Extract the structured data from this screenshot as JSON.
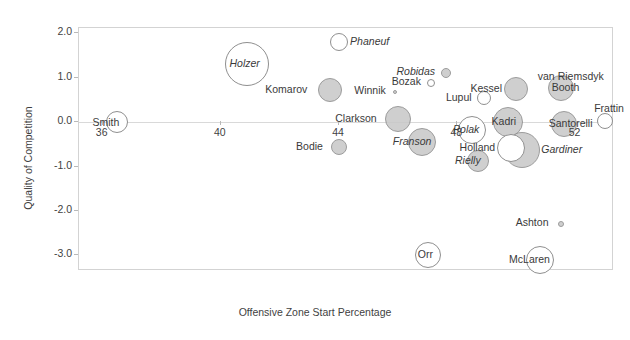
{
  "chart_data": {
    "type": "scatter",
    "title": "",
    "xlabel": "Offensive Zone Start Percentage",
    "ylabel": "Quality of Competition",
    "xlim": [
      35.2,
      53.3
    ],
    "ylim": [
      -3.35,
      2.12
    ],
    "xticks": [
      36,
      40,
      44,
      48,
      52
    ],
    "yticks": [
      2.0,
      1.0,
      0.0,
      -1.0,
      -2.0,
      -3.0
    ],
    "xtick_labels": [
      "36",
      "40",
      "44",
      "48",
      "52"
    ],
    "ytick_labels": [
      "2.0",
      "1.0",
      "0.0",
      "-1.0",
      "-2.0",
      "-3.0"
    ],
    "grid": false,
    "legend": "none",
    "bubble_size_meaning": "time on ice",
    "points": [
      {
        "name": "Smith",
        "x": 36.5,
        "y": 0.0,
        "r": 11,
        "fill": "hollow",
        "label_dx": -24,
        "label_dy": -4,
        "italic": false
      },
      {
        "name": "Holzer",
        "x": 40.9,
        "y": 1.32,
        "r": 22,
        "fill": "hollow",
        "label_dx": -17,
        "label_dy": -5,
        "italic": true
      },
      {
        "name": "Phaneuf",
        "x": 44.0,
        "y": 1.8,
        "r": 9,
        "fill": "hollow",
        "label_dx": 12,
        "label_dy": -5,
        "italic": true
      },
      {
        "name": "Komarov",
        "x": 43.7,
        "y": 0.72,
        "r": 12,
        "fill": "fill",
        "label_dx": -64,
        "label_dy": -5,
        "italic": false
      },
      {
        "name": "Robidas",
        "x": 47.6,
        "y": 1.1,
        "r": 5,
        "fill": "fill",
        "label_dx": -48,
        "label_dy": -6,
        "italic": true
      },
      {
        "name": "Bozak",
        "x": 47.1,
        "y": 0.88,
        "r": 4,
        "fill": "hollow",
        "label_dx": -38,
        "label_dy": -6,
        "italic": false
      },
      {
        "name": "Winnik",
        "x": 45.9,
        "y": 0.68,
        "r": 2,
        "fill": "fill",
        "label_dx": -40,
        "label_dy": -6,
        "italic": false
      },
      {
        "name": "Kessel",
        "x": 50.0,
        "y": 0.75,
        "r": 12,
        "fill": "fill",
        "label_dx": -45,
        "label_dy": -5,
        "italic": false
      },
      {
        "name": "Lupul",
        "x": 48.9,
        "y": 0.55,
        "r": 7,
        "fill": "hollow",
        "label_dx": -37,
        "label_dy": -5,
        "italic": false
      },
      {
        "name": "van Riemsdyk",
        "x": 51.5,
        "y": 0.78,
        "r": 13,
        "fill": "fill",
        "label_dx": -22,
        "label_dy": -16,
        "italic": false
      },
      {
        "name": "Booth",
        "x": 51.5,
        "y": 0.78,
        "r": 0,
        "fill": "fill",
        "label_dx": -8,
        "label_dy": -5,
        "italic": false
      },
      {
        "name": "Clarkson",
        "x": 46.0,
        "y": 0.08,
        "r": 13,
        "fill": "fill",
        "label_dx": -62,
        "label_dy": -5,
        "italic": false
      },
      {
        "name": "Kadri",
        "x": 49.7,
        "y": 0.0,
        "r": 15,
        "fill": "fill",
        "label_dx": -15,
        "label_dy": -5,
        "italic": false
      },
      {
        "name": "Polak",
        "x": 48.5,
        "y": -0.18,
        "r": 14,
        "fill": "hollow",
        "label_dx": -18,
        "label_dy": -5,
        "italic": true
      },
      {
        "name": "Santorelli",
        "x": 51.6,
        "y": -0.05,
        "r": 13,
        "fill": "fill",
        "label_dx": -14,
        "label_dy": -5,
        "italic": false
      },
      {
        "name": "Frattin",
        "x": 53.0,
        "y": 0.03,
        "r": 8,
        "fill": "hollow",
        "label_dx": -10,
        "label_dy": -17,
        "italic": false
      },
      {
        "name": "Bodie",
        "x": 44.0,
        "y": -0.55,
        "r": 8,
        "fill": "fill",
        "label_dx": -42,
        "label_dy": -5,
        "italic": false
      },
      {
        "name": "Franson",
        "x": 46.8,
        "y": -0.45,
        "r": 14,
        "fill": "fill",
        "label_dx": -28,
        "label_dy": -5,
        "italic": true
      },
      {
        "name": "Holland",
        "x": 49.8,
        "y": -0.58,
        "r": 14,
        "fill": "hollow",
        "label_dx": -50,
        "label_dy": -5,
        "italic": false
      },
      {
        "name": "Gardiner",
        "x": 50.2,
        "y": -0.62,
        "r": 18,
        "fill": "fill",
        "label_dx": 20,
        "label_dy": -5,
        "italic": true
      },
      {
        "name": "Rielly",
        "x": 48.7,
        "y": -0.88,
        "r": 11,
        "fill": "fill",
        "label_dx": -22,
        "label_dy": -5,
        "italic": true
      },
      {
        "name": "Ashton",
        "x": 51.5,
        "y": -2.3,
        "r": 3,
        "fill": "fill",
        "label_dx": -44,
        "label_dy": -6,
        "italic": false
      },
      {
        "name": "Orr",
        "x": 47.0,
        "y": -3.0,
        "r": 13,
        "fill": "hollow",
        "label_dx": -9,
        "label_dy": -5,
        "italic": false
      },
      {
        "name": "McLaren",
        "x": 50.8,
        "y": -3.1,
        "r": 14,
        "fill": "hollow",
        "label_dx": -30,
        "label_dy": -5,
        "italic": false
      }
    ]
  }
}
